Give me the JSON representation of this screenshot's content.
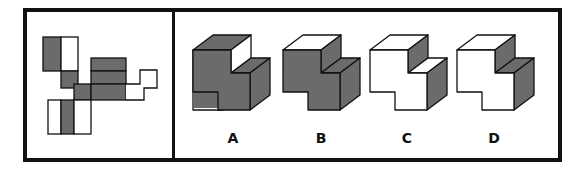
{
  "puzzle": {
    "type": "cube-net folding",
    "colors": {
      "shaded": "#6b6b6b",
      "blank": "#ffffff",
      "stroke": "#111111"
    },
    "net": {
      "description": "Unfolded net of a stepped 3D shape with shaded and blank faces"
    },
    "options": [
      {
        "label": "A",
        "faces": {
          "upper_top": "shaded",
          "step_side": "blank",
          "lower_top": "shaded",
          "right_side": "shaded",
          "front": "shaded"
        }
      },
      {
        "label": "B",
        "faces": {
          "upper_top": "blank",
          "step_side": "shaded",
          "lower_top": "shaded",
          "right_side": "shaded",
          "front": "shaded"
        }
      },
      {
        "label": "C",
        "faces": {
          "upper_top": "blank",
          "step_side": "shaded",
          "lower_top": "blank",
          "right_side": "shaded",
          "front": "blank"
        }
      },
      {
        "label": "D",
        "faces": {
          "upper_top": "blank",
          "step_side": "shaded",
          "lower_top": "shaded",
          "right_side": "shaded",
          "front": "blank"
        }
      }
    ]
  }
}
